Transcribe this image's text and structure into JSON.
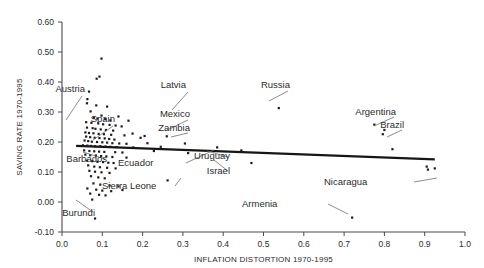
{
  "figure": {
    "title": "",
    "background_color": "#ffffff"
  },
  "axes": {
    "x_title": "INFLATION DISTORTION 1970-1995",
    "y_title": "SAVING RATE 1970-1995",
    "x_ticks": [
      "0.0",
      "0.1",
      "0.2",
      "0.3",
      "0.4",
      "0.5",
      "0.6",
      "0.7",
      "0.8",
      "0.9",
      "1.0"
    ],
    "y_ticks": [
      "-0.10",
      "0.00",
      "0.10",
      "0.20",
      "0.30",
      "0.40",
      "0.50",
      "0.60"
    ]
  },
  "chart_data": {
    "type": "scatter",
    "title": "",
    "xlabel": "INFLATION DISTORTION 1970-1995",
    "ylabel": "SAVING RATE 1970-1995",
    "xlim": [
      0.0,
      1.0
    ],
    "ylim": [
      -0.1,
      0.6
    ],
    "xticks": [
      0.0,
      0.1,
      0.2,
      0.3,
      0.4,
      0.5,
      0.6,
      0.7,
      0.8,
      0.9,
      1.0
    ],
    "yticks": [
      -0.1,
      0.0,
      0.1,
      0.2,
      0.3,
      0.4,
      0.5,
      0.6
    ],
    "grid": false,
    "legend": "none",
    "marker_color": "#1c1c1c",
    "trend_line": {
      "color": "#161616",
      "x_start": 0.035,
      "y_start": 0.187,
      "x_end": 0.925,
      "y_end": 0.142
    },
    "points": [
      [
        0.098,
        0.478
      ],
      [
        0.093,
        0.418
      ],
      [
        0.086,
        0.411
      ],
      [
        0.067,
        0.368
      ],
      [
        0.063,
        0.343
      ],
      [
        0.062,
        0.329
      ],
      [
        0.085,
        0.322
      ],
      [
        0.112,
        0.318
      ],
      [
        0.538,
        0.313
      ],
      [
        0.071,
        0.302
      ],
      [
        0.098,
        0.288
      ],
      [
        0.14,
        0.285
      ],
      [
        0.079,
        0.281
      ],
      [
        0.088,
        0.278
      ],
      [
        0.107,
        0.276
      ],
      [
        0.12,
        0.272
      ],
      [
        0.165,
        0.271
      ],
      [
        0.06,
        0.266
      ],
      [
        0.073,
        0.264
      ],
      [
        0.09,
        0.262
      ],
      [
        0.102,
        0.259
      ],
      [
        0.118,
        0.257
      ],
      [
        0.133,
        0.255
      ],
      [
        0.148,
        0.252
      ],
      [
        0.062,
        0.248
      ],
      [
        0.076,
        0.246
      ],
      [
        0.083,
        0.244
      ],
      [
        0.096,
        0.242
      ],
      [
        0.109,
        0.24
      ],
      [
        0.127,
        0.238
      ],
      [
        0.775,
        0.258
      ],
      [
        0.8,
        0.24
      ],
      [
        0.796,
        0.226
      ],
      [
        0.058,
        0.232
      ],
      [
        0.067,
        0.23
      ],
      [
        0.078,
        0.229
      ],
      [
        0.091,
        0.227
      ],
      [
        0.104,
        0.226
      ],
      [
        0.122,
        0.224
      ],
      [
        0.155,
        0.222
      ],
      [
        0.175,
        0.228
      ],
      [
        0.205,
        0.22
      ],
      [
        0.06,
        0.218
      ],
      [
        0.07,
        0.216
      ],
      [
        0.081,
        0.214
      ],
      [
        0.093,
        0.213
      ],
      [
        0.106,
        0.212
      ],
      [
        0.117,
        0.21
      ],
      [
        0.13,
        0.208
      ],
      [
        0.195,
        0.214
      ],
      [
        0.26,
        0.219
      ],
      [
        0.056,
        0.205
      ],
      [
        0.065,
        0.203
      ],
      [
        0.074,
        0.201
      ],
      [
        0.087,
        0.2
      ],
      [
        0.1,
        0.199
      ],
      [
        0.112,
        0.198
      ],
      [
        0.125,
        0.196
      ],
      [
        0.142,
        0.195
      ],
      [
        0.16,
        0.194
      ],
      [
        0.212,
        0.196
      ],
      [
        0.305,
        0.195
      ],
      [
        0.052,
        0.189
      ],
      [
        0.063,
        0.188
      ],
      [
        0.072,
        0.187
      ],
      [
        0.082,
        0.186
      ],
      [
        0.095,
        0.186
      ],
      [
        0.108,
        0.185
      ],
      [
        0.12,
        0.184
      ],
      [
        0.135,
        0.183
      ],
      [
        0.177,
        0.182
      ],
      [
        0.245,
        0.184
      ],
      [
        0.385,
        0.182
      ],
      [
        0.82,
        0.176
      ],
      [
        0.055,
        0.172
      ],
      [
        0.068,
        0.17
      ],
      [
        0.08,
        0.169
      ],
      [
        0.092,
        0.168
      ],
      [
        0.105,
        0.167
      ],
      [
        0.132,
        0.166
      ],
      [
        0.15,
        0.165
      ],
      [
        0.228,
        0.17
      ],
      [
        0.313,
        0.163
      ],
      [
        0.445,
        0.172
      ],
      [
        0.058,
        0.158
      ],
      [
        0.07,
        0.156
      ],
      [
        0.084,
        0.155
      ],
      [
        0.097,
        0.153
      ],
      [
        0.11,
        0.152
      ],
      [
        0.125,
        0.15
      ],
      [
        0.16,
        0.148
      ],
      [
        0.47,
        0.13
      ],
      [
        0.062,
        0.138
      ],
      [
        0.075,
        0.136
      ],
      [
        0.088,
        0.134
      ],
      [
        0.102,
        0.133
      ],
      [
        0.115,
        0.131
      ],
      [
        0.128,
        0.13
      ],
      [
        0.905,
        0.118
      ],
      [
        0.908,
        0.108
      ],
      [
        0.925,
        0.112
      ],
      [
        0.065,
        0.122
      ],
      [
        0.08,
        0.118
      ],
      [
        0.094,
        0.116
      ],
      [
        0.112,
        0.114
      ],
      [
        0.133,
        0.112
      ],
      [
        0.068,
        0.104
      ],
      [
        0.082,
        0.101
      ],
      [
        0.098,
        0.099
      ],
      [
        0.118,
        0.097
      ],
      [
        0.072,
        0.086
      ],
      [
        0.09,
        0.082
      ],
      [
        0.106,
        0.079
      ],
      [
        0.262,
        0.072
      ],
      [
        0.078,
        0.062
      ],
      [
        0.095,
        0.058
      ],
      [
        0.118,
        0.055
      ],
      [
        0.14,
        0.052
      ],
      [
        0.063,
        0.045
      ],
      [
        0.085,
        0.041
      ],
      [
        0.1,
        0.038
      ],
      [
        0.122,
        0.036
      ],
      [
        0.15,
        0.04
      ],
      [
        0.07,
        0.028
      ],
      [
        0.092,
        0.024
      ],
      [
        0.108,
        0.022
      ],
      [
        0.075,
        0.008
      ],
      [
        0.082,
        -0.055
      ],
      [
        0.72,
        -0.052
      ]
    ],
    "annotations": [
      {
        "label": "Austria",
        "label_x": 85,
        "label_y": 92,
        "leader": [
          82,
          96,
          66,
          120
        ]
      },
      {
        "label": "Spain",
        "label_x": 115,
        "label_y": 122,
        "leader": [
          113,
          126,
          93,
          140
        ]
      },
      {
        "label": "Latvia",
        "label_x": 186,
        "label_y": 88,
        "leader": [
          188,
          92,
          172,
          110
        ]
      },
      {
        "label": "Mexico",
        "label_x": 190,
        "label_y": 117,
        "leader": [
          188,
          120,
          165,
          131
        ]
      },
      {
        "label": "Zambia",
        "label_x": 190,
        "label_y": 131,
        "leader": [
          188,
          133,
          171,
          137
        ]
      },
      {
        "label": "Russia",
        "label_x": 290,
        "label_y": 88,
        "leader": [
          288,
          91,
          269,
          101
        ]
      },
      {
        "label": "Argentina",
        "label_x": 396,
        "label_y": 115,
        "leader": [
          394,
          117,
          374,
          126
        ]
      },
      {
        "label": "Brazil",
        "label_x": 404,
        "label_y": 128,
        "leader": [
          402,
          130,
          387,
          137
        ]
      },
      {
        "label": "Barbados",
        "label_x": 107,
        "label_y": 162,
        "leader": [
          105,
          159,
          83,
          152
        ]
      },
      {
        "label": "Ecuador",
        "label_x": 166,
        "label_y": 166,
        "leader": [
          186,
          163,
          214,
          150
        ]
      },
      {
        "label": "Uruguay",
        "label_x": 230,
        "label_y": 159,
        "leader": [
          228,
          157,
          207,
          151
        ]
      },
      {
        "label": "Israel",
        "label_x": 230,
        "label_y": 174,
        "leader": [
          228,
          171,
          214,
          160
        ]
      },
      {
        "label": "Sierra Leone",
        "label_x": 150,
        "label_y": 189,
        "leader": [
          175,
          186,
          181,
          178
        ]
      },
      {
        "label": "Nicaragua",
        "label_x": 372,
        "label_y": 185,
        "leader": [
          414,
          182,
          437,
          178
        ]
      },
      {
        "label": "Armenia",
        "label_x": 290,
        "label_y": 207,
        "leader": [
          328,
          204,
          348,
          214
        ]
      },
      {
        "label": "Burundi",
        "label_x": 95,
        "label_y": 216,
        "leader": [
          93,
          212,
          76,
          200
        ]
      }
    ]
  }
}
